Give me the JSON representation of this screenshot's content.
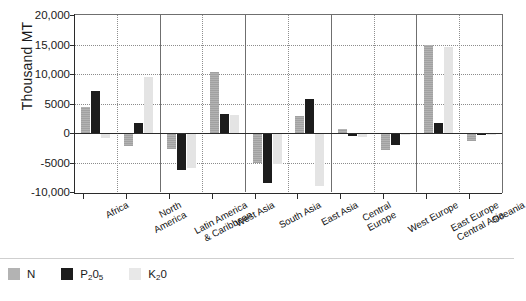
{
  "chart_data": {
    "type": "bar",
    "title": "",
    "subtitle": "",
    "xlabel": "",
    "ylabel": "Thousand MT",
    "ylim": [
      -10000,
      20000
    ],
    "ytick_values": [
      20000,
      15000,
      10000,
      5000,
      0,
      -5000,
      -10000
    ],
    "ytick_labels": [
      "20,000",
      "15,000",
      "10,000",
      "5000",
      "0",
      "-5000",
      "-10,000"
    ],
    "grid": true,
    "legend_position": "bottom-left",
    "categories": [
      "Africa",
      "North America",
      "Latin America & Caribbean",
      "West Asia",
      "South Asia",
      "East Asia",
      "Central Europe",
      "West Europe",
      "East Europe Central Asia",
      "Oceania"
    ],
    "category_lines": [
      [
        "Africa"
      ],
      [
        "North",
        "America"
      ],
      [
        "Latin America",
        "& Caribbean"
      ],
      [
        "West Asia"
      ],
      [
        "South Asia"
      ],
      [
        "East Asia"
      ],
      [
        "Central",
        "Europe"
      ],
      [
        "West Europe"
      ],
      [
        "East Europe",
        "Central Asia"
      ],
      [
        "Oceania"
      ]
    ],
    "series": [
      {
        "name": "N",
        "color": "#b3b3b3",
        "values": [
          4400,
          -2200,
          -2700,
          10400,
          -5000,
          2900,
          700,
          -2900,
          15000,
          -1400
        ]
      },
      {
        "name": "P2O5",
        "color": "#1c1c1c",
        "values": [
          7100,
          1700,
          -6300,
          3300,
          -8500,
          5700,
          -500,
          -2100,
          1700,
          -400
        ]
      },
      {
        "name": "K2O",
        "color": "#e4e4e4",
        "values": [
          -900,
          9500,
          -5900,
          3000,
          -5300,
          -8900,
          -600,
          -300,
          14500,
          -100
        ]
      }
    ],
    "legend": [
      {
        "label": "N",
        "base": "N",
        "sub": "",
        "post": "",
        "swatch": "n"
      },
      {
        "label": "P2O5",
        "base": "P",
        "sub": "2",
        "post": "0",
        "sub2": "5",
        "swatch": "p"
      },
      {
        "label": "K2O",
        "base": "K",
        "sub": "2",
        "post": "0",
        "sub2": "",
        "swatch": "k"
      }
    ]
  },
  "legend_labels": {
    "n": "N",
    "p_base": "P",
    "p_sub1": "2",
    "p_mid": "0",
    "p_sub2": "5",
    "k_base": "K",
    "k_sub1": "2",
    "k_mid": "0"
  },
  "axis": {
    "y_title": "Thousand MT"
  }
}
